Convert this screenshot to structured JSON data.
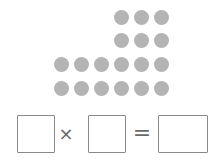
{
  "dots": {
    "color": "#b4b4b4",
    "rows": [
      {
        "y": 10,
        "xs": [
          114,
          134,
          154
        ]
      },
      {
        "y": 33,
        "xs": [
          114,
          134,
          154
        ]
      },
      {
        "y": 57,
        "xs": [
          54,
          74,
          94,
          114,
          134,
          154
        ]
      },
      {
        "y": 81,
        "xs": [
          54,
          74,
          94,
          114,
          134,
          154
        ]
      }
    ]
  },
  "equation": {
    "factor1": "",
    "operator_times": "×",
    "factor2": "",
    "operator_equals": "=",
    "product": ""
  }
}
